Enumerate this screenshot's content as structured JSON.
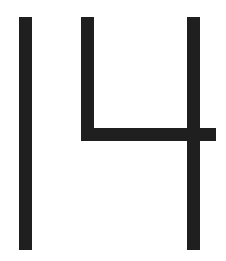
{
  "glyph": {
    "text": "14",
    "color": "#1f1f1f",
    "background": "#ffffff"
  }
}
